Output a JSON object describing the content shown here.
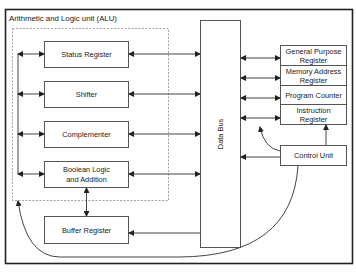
{
  "diagram": {
    "title": "Arithmetic and Logic unit (ALU)",
    "alu_blocks": [
      {
        "id": "status",
        "label": "Status Register"
      },
      {
        "id": "shifter",
        "label": "Shifter"
      },
      {
        "id": "complementer",
        "label": "Complementer"
      },
      {
        "id": "boolean",
        "label_line1": "Boolean Logic",
        "label_line2": "and Addition"
      }
    ],
    "buffer_register": {
      "label": "Buffer Register"
    },
    "data_bus": {
      "label": "Data Bus"
    },
    "registers": [
      {
        "id": "gpr",
        "label_line1": "General Purpose",
        "label_line2": "Register"
      },
      {
        "id": "mar",
        "label_line1": "Memory Address",
        "label_line2": "Register"
      },
      {
        "id": "pc",
        "label": "Program Counter"
      },
      {
        "id": "ir",
        "label_line1": "Instruction",
        "label_line2": "Register"
      }
    ],
    "control_unit": {
      "label": "Control Unit"
    },
    "colors": {
      "stroke": "#444444",
      "frame": "#222222",
      "background": "#ffffff"
    }
  }
}
